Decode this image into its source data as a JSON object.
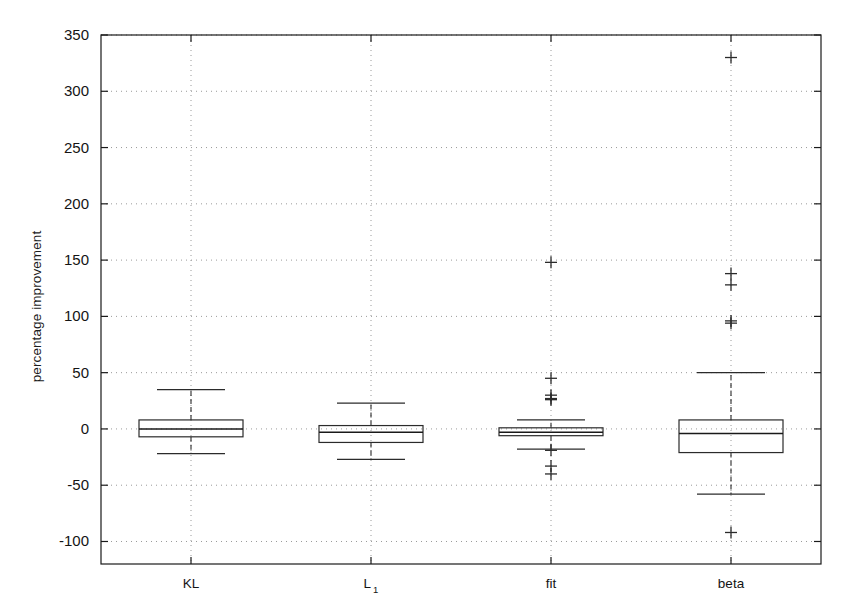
{
  "chart_data": {
    "type": "box",
    "title": "",
    "xlabel": "",
    "ylabel": "percentage improvement",
    "ylim": [
      -120,
      350
    ],
    "ytick_values": [
      350,
      300,
      250,
      200,
      150,
      100,
      50,
      0,
      -50,
      -100
    ],
    "ytick_labels": [
      "350",
      "300",
      "250",
      "200",
      "150",
      "100",
      "50",
      "0",
      "-50",
      "-100"
    ],
    "categories": [
      "KL",
      "L 1",
      "fit",
      "beta"
    ],
    "category_labels": [
      {
        "main": "KL",
        "sub": ""
      },
      {
        "main": "L",
        "sub": "1"
      },
      {
        "main": "fit",
        "sub": ""
      },
      {
        "main": "beta",
        "sub": ""
      }
    ],
    "grid": "dotted-both",
    "legend": "none",
    "boxes": [
      {
        "name": "KL",
        "whisker_high": 35,
        "q3": 8,
        "median": 0,
        "q1": -7,
        "whisker_low": -22,
        "outliers": []
      },
      {
        "name": "L 1",
        "whisker_high": 23,
        "q3": 3,
        "median": -3,
        "q1": -12,
        "whisker_low": -27,
        "outliers": []
      },
      {
        "name": "fit",
        "whisker_high": 8,
        "q3": 1,
        "median": -3,
        "q1": -6,
        "whisker_low": -18,
        "outliers": [
          148,
          45,
          30,
          27,
          26,
          -19,
          -33,
          -40
        ]
      },
      {
        "name": "beta",
        "whisker_high": 50,
        "q3": 8,
        "median": -4,
        "q1": -21,
        "whisker_low": -58,
        "outliers": [
          330,
          138,
          128,
          96,
          94,
          -92
        ]
      }
    ],
    "colors": {
      "axis": "#1a1a1a",
      "box_edge": "#2b2b2b",
      "median": "#1a1a1a",
      "whisker": "#2b2b2b",
      "outlier": "#2b2b2b",
      "grid": "#9a9a9a",
      "background": "#ffffff"
    }
  },
  "axes": {
    "ylabel_text": "percentage improvement"
  }
}
